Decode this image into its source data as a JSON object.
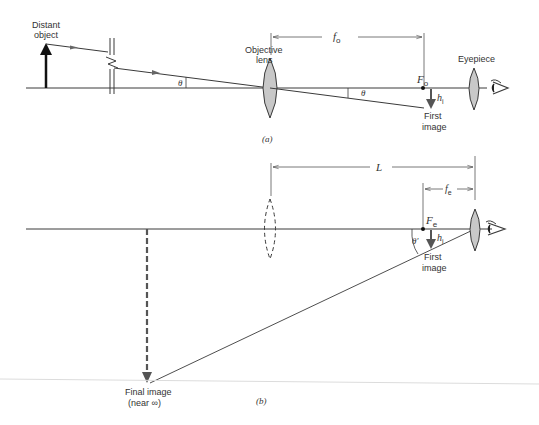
{
  "diagram": {
    "type": "optics-ray-diagram",
    "panel_a": {
      "caption": "(a)",
      "labels": {
        "distant_object_line1": "Distant",
        "distant_object_line2": "object",
        "objective_line1": "Objective",
        "objective_line2": "lens",
        "eyepiece": "Eyepiece",
        "focal_length": "f",
        "focal_length_sub": "o",
        "focal_point": "F",
        "focal_point_sub": "o",
        "image_height": "h",
        "image_height_sub": "i",
        "first_image_line1": "First",
        "first_image_line2": "image",
        "angle_left": "θ",
        "angle_right": "θ"
      }
    },
    "panel_b": {
      "caption": "(b)",
      "labels": {
        "length": "L",
        "focal_length": "f",
        "focal_length_sub": "e",
        "focal_point": "F",
        "focal_point_sub": "e",
        "image_height": "h",
        "image_height_sub": "i",
        "first_image_line1": "First",
        "first_image_line2": "image",
        "angle": "θ′",
        "final_image_line1": "Final image",
        "final_image_line2": "(near ∞)"
      }
    },
    "colors": {
      "line": "#3a3a3a",
      "lens_fill": "#c8c8c8",
      "axis_light": "#d8d8d8",
      "text": "#333333"
    }
  }
}
